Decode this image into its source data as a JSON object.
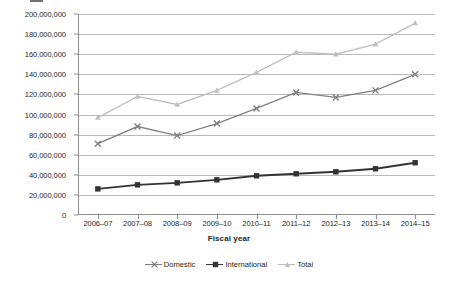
{
  "chart_data": {
    "type": "line",
    "title": "",
    "xlabel": "Fiscal year",
    "ylabel": "",
    "categories": [
      "2006–07",
      "2007–08",
      "2008–09",
      "2009–10",
      "2010–11",
      "2011–12",
      "2012–13",
      "2013–14",
      "2014–15"
    ],
    "ylim": [
      0,
      200000000
    ],
    "ytick_values": [
      0,
      20000000,
      40000000,
      60000000,
      80000000,
      100000000,
      120000000,
      140000000,
      160000000,
      180000000,
      200000000
    ],
    "ytick_labels": [
      "0",
      "20,000,000",
      "40,000,000",
      "60,000,000",
      "80,000,000",
      "100,000,000",
      "120,000,000",
      "140,000,000",
      "160,000,000",
      "180,000,000",
      "200,000,000"
    ],
    "grid": true,
    "legend_position": "bottom",
    "series": [
      {
        "name": "Domestic",
        "color": "#808080",
        "marker": "x",
        "values": [
          71000000,
          88000000,
          79000000,
          91000000,
          106000000,
          122000000,
          117000000,
          124000000,
          140000000
        ]
      },
      {
        "name": "International",
        "color": "#333333",
        "marker": "square",
        "values": [
          26000000,
          30000000,
          32000000,
          35000000,
          39000000,
          41000000,
          43000000,
          46000000,
          52000000
        ]
      },
      {
        "name": "Total",
        "color": "#bfbfbf",
        "marker": "triangle",
        "values": [
          97000000,
          118000000,
          110000000,
          124000000,
          142000000,
          162000000,
          160000000,
          170000000,
          191000000
        ]
      }
    ]
  },
  "axis": {
    "x_title": "Fiscal year"
  },
  "legend": {
    "items": [
      {
        "label": "Domestic"
      },
      {
        "label": "International"
      },
      {
        "label": "Total"
      }
    ]
  }
}
